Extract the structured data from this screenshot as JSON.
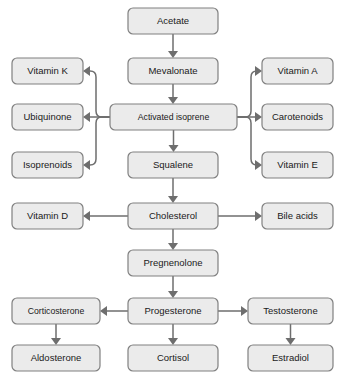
{
  "diagram": {
    "type": "flowchart",
    "background_color": "#ffffff",
    "node_fill_color": "#ebebeb",
    "node_border_color": "#808080",
    "edge_color": "#6e6e6e",
    "text_color": "#1a1a1a"
  },
  "nodes": [
    {
      "id": "acetate",
      "label": "Acetate",
      "x": 128,
      "y": 8,
      "w": 90,
      "h": 26,
      "column": "center"
    },
    {
      "id": "mevalonate",
      "label": "Mevalonate",
      "x": 128,
      "y": 58,
      "w": 90,
      "h": 26,
      "column": "center"
    },
    {
      "id": "activated",
      "label": "Activated isoprene",
      "x": 110,
      "y": 104,
      "w": 127,
      "h": 26,
      "column": "center"
    },
    {
      "id": "squalene",
      "label": "Squalene",
      "x": 128,
      "y": 152,
      "w": 90,
      "h": 26,
      "column": "center"
    },
    {
      "id": "cholesterol",
      "label": "Cholesterol",
      "x": 128,
      "y": 203,
      "w": 90,
      "h": 26,
      "column": "center"
    },
    {
      "id": "pregnenolone",
      "label": "Pregnenolone",
      "x": 128,
      "y": 250,
      "w": 90,
      "h": 26,
      "column": "center"
    },
    {
      "id": "progesterone",
      "label": "Progesterone",
      "x": 128,
      "y": 298,
      "w": 90,
      "h": 26,
      "column": "center"
    },
    {
      "id": "cortisol",
      "label": "Cortisol",
      "x": 128,
      "y": 345,
      "w": 90,
      "h": 26,
      "column": "center"
    },
    {
      "id": "vitamin_k",
      "label": "Vitamin K",
      "x": 12,
      "y": 58,
      "w": 71,
      "h": 26,
      "column": "left"
    },
    {
      "id": "ubiquinone",
      "label": "Ubiquinone",
      "x": 12,
      "y": 104,
      "w": 71,
      "h": 26,
      "column": "left"
    },
    {
      "id": "isoprenoids",
      "label": "Isoprenoids",
      "x": 12,
      "y": 152,
      "w": 71,
      "h": 26,
      "column": "left"
    },
    {
      "id": "vitamin_d",
      "label": "Vitamin D",
      "x": 12,
      "y": 203,
      "w": 71,
      "h": 26,
      "column": "left"
    },
    {
      "id": "corticosterone",
      "label": "Corticosterone",
      "x": 12,
      "y": 298,
      "w": 88,
      "h": 26,
      "column": "left"
    },
    {
      "id": "aldosterone",
      "label": "Aldosterone",
      "x": 12,
      "y": 345,
      "w": 88,
      "h": 26,
      "column": "left"
    },
    {
      "id": "vitamin_a",
      "label": "Vitamin A",
      "x": 262,
      "y": 58,
      "w": 71,
      "h": 26,
      "column": "right"
    },
    {
      "id": "carotenoids",
      "label": "Carotenoids",
      "x": 262,
      "y": 104,
      "w": 71,
      "h": 26,
      "column": "right"
    },
    {
      "id": "vitamin_e",
      "label": "Vitamin E",
      "x": 262,
      "y": 152,
      "w": 71,
      "h": 26,
      "column": "right"
    },
    {
      "id": "bile_acids",
      "label": "Bile acids",
      "x": 262,
      "y": 203,
      "w": 71,
      "h": 26,
      "column": "right"
    },
    {
      "id": "testosterone",
      "label": "Testosterone",
      "x": 248,
      "y": 298,
      "w": 85,
      "h": 26,
      "column": "right"
    },
    {
      "id": "estradiol",
      "label": "Estradiol",
      "x": 248,
      "y": 345,
      "w": 85,
      "h": 26,
      "column": "right"
    }
  ],
  "edges": [
    {
      "id": "acetate-mevalonate",
      "from": "acetate",
      "to": "mevalonate",
      "kind": "vertical"
    },
    {
      "id": "mevalonate-activated",
      "from": "mevalonate",
      "to": "activated",
      "kind": "vertical"
    },
    {
      "id": "activated-squalene",
      "from": "activated",
      "to": "squalene",
      "kind": "vertical"
    },
    {
      "id": "squalene-cholesterol",
      "from": "squalene",
      "to": "cholesterol",
      "kind": "vertical"
    },
    {
      "id": "cholesterol-pregnenolone",
      "from": "cholesterol",
      "to": "pregnenolone",
      "kind": "vertical"
    },
    {
      "id": "pregnenolone-progesterone",
      "from": "pregnenolone",
      "to": "progesterone",
      "kind": "vertical"
    },
    {
      "id": "progesterone-cortisol",
      "from": "progesterone",
      "to": "cortisol",
      "kind": "vertical"
    },
    {
      "id": "corticosterone-aldosterone",
      "from": "corticosterone",
      "to": "aldosterone",
      "kind": "vertical"
    },
    {
      "id": "testosterone-estradiol",
      "from": "testosterone",
      "to": "estradiol",
      "kind": "vertical"
    },
    {
      "id": "activated-ubiquinone",
      "from": "activated",
      "to": "ubiquinone",
      "kind": "horizontal-left"
    },
    {
      "id": "activated-carotenoids",
      "from": "activated",
      "to": "carotenoids",
      "kind": "horizontal-right"
    },
    {
      "id": "cholesterol-vitamin_d",
      "from": "cholesterol",
      "to": "vitamin_d",
      "kind": "horizontal-left"
    },
    {
      "id": "cholesterol-bile_acids",
      "from": "cholesterol",
      "to": "bile_acids",
      "kind": "horizontal-right"
    },
    {
      "id": "progesterone-corticosterone",
      "from": "progesterone",
      "to": "corticosterone",
      "kind": "horizontal-left"
    },
    {
      "id": "progesterone-testosterone",
      "from": "progesterone",
      "to": "testosterone",
      "kind": "horizontal-right"
    },
    {
      "id": "activated-vitamin_k",
      "from": "activated",
      "to": "vitamin_k",
      "kind": "elbow-left-up",
      "stub": 96
    },
    {
      "id": "activated-isoprenoids",
      "from": "activated",
      "to": "isoprenoids",
      "kind": "elbow-left-down",
      "stub": 96
    },
    {
      "id": "activated-vitamin_a",
      "from": "activated",
      "to": "vitamin_a",
      "kind": "elbow-right-up",
      "stub": 251
    },
    {
      "id": "activated-vitamin_e",
      "from": "activated",
      "to": "vitamin_e",
      "kind": "elbow-right-down",
      "stub": 251
    }
  ]
}
